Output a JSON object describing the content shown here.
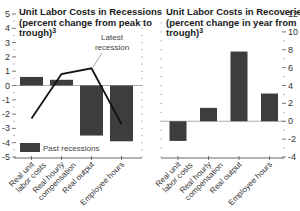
{
  "chart_data": [
    {
      "type": "bar",
      "title": "Unit Labor Costs in Recessions (percent change from peak to trough)",
      "title_lines": [
        "Unit Labor Costs in Recessions",
        "(percent change from peak to",
        "trough)"
      ],
      "footnote_marker": "3",
      "categories": [
        "Real unit labor costs",
        "Real hourly compensation",
        "Real output",
        "Employee hours"
      ],
      "category_lines": [
        [
          "Real unit",
          "labor costs"
        ],
        [
          "Real hourly",
          "compensation"
        ],
        [
          "Real output"
        ],
        [
          "Employee hours"
        ]
      ],
      "series": [
        {
          "name": "Past recessions",
          "kind": "bar",
          "values": [
            0.6,
            0.4,
            -3.5,
            -3.9
          ]
        },
        {
          "name": "Latest recession",
          "kind": "line",
          "values": [
            -2.3,
            0.8,
            1.2,
            -2.7
          ]
        }
      ],
      "ylim": [
        -5,
        5
      ],
      "yticks": [
        5,
        4,
        3,
        2,
        1,
        0,
        -1,
        -2,
        -3,
        -4,
        -5
      ],
      "ytick_labels": [
        "5",
        "4",
        "3",
        "2",
        "1",
        "0",
        "-1",
        "-2",
        "-3",
        "-4",
        "-5"
      ],
      "axis_side": "left",
      "legend": {
        "label": "Past recessions",
        "position": "lower-left"
      },
      "annotation": "Latest recession",
      "annotation_lines": [
        "Latest",
        "recession"
      ]
    },
    {
      "type": "bar",
      "title": "Unit Labor Costs in Recoveries (percent change in year from trough)",
      "title_lines": [
        "Unit Labor Costs in Recoveries",
        "(percent change in year from",
        "trough)"
      ],
      "footnote_marker": "3",
      "categories": [
        "Real unit labor costs",
        "Real hourly compensation",
        "Real output",
        "Employee hours"
      ],
      "category_lines": [
        [
          "Real unit",
          "labor costs"
        ],
        [
          "Real hourly",
          "compensation"
        ],
        [
          "Real output"
        ],
        [
          "Employee hours"
        ]
      ],
      "series": [
        {
          "name": "Recoveries",
          "kind": "bar",
          "values": [
            -2.2,
            1.5,
            7.8,
            3.1
          ]
        }
      ],
      "ylim": [
        -4,
        12
      ],
      "yticks": [
        12,
        10,
        8,
        6,
        4,
        2,
        0,
        -2,
        -4
      ],
      "ytick_labels": [
        "12",
        "10",
        "8",
        "6",
        "4",
        "2",
        "0",
        "-2",
        "-4"
      ],
      "axis_side": "right"
    }
  ],
  "colors": {
    "bar": "#3d3d3d",
    "line": "#111111",
    "axis": "#555555"
  }
}
